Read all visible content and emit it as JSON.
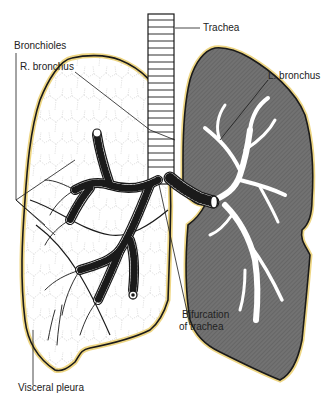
{
  "figure": {
    "colors": {
      "pleura_outline": "#1a1a1a",
      "pleura_glow": "#e8c650",
      "left_lung_fill": "#6e6e6e",
      "right_lung_fill": "#ffffff",
      "bronchi_fill": "#ffffff",
      "lobule_lines": "#b5b5b5"
    }
  },
  "labels": {
    "trachea": "Trachea",
    "bronchioles": "Bronchioles",
    "r_bronchus": "R. bronchus",
    "l_bronchus": "L. bronchus",
    "bifurcation_line1": "Bifurcation",
    "bifurcation_line2": "of trachea",
    "visceral_pleura": "Visceral pleura"
  }
}
